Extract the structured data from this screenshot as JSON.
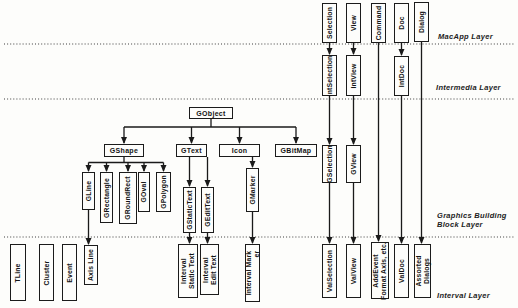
{
  "canvas": {
    "width": 518,
    "height": 308,
    "background": "#fdfdfb",
    "ink": "#1a1a1a"
  },
  "layers": [
    {
      "id": "macapp",
      "label_lines": [
        "MacApp Layer"
      ],
      "label_x": 438,
      "label_y": 32,
      "divider_y": 44
    },
    {
      "id": "intermedia",
      "label_lines": [
        "Intermedia Layer"
      ],
      "label_x": 436,
      "label_y": 83,
      "divider_y": 99
    },
    {
      "id": "graphics",
      "label_lines": [
        "Graphics Building",
        "Block Layer"
      ],
      "label_x": 437,
      "label_y": 211,
      "divider_y": 237
    },
    {
      "id": "interval",
      "label_lines": [
        "Interval Layer"
      ],
      "label_x": 437,
      "label_y": 291,
      "divider_y": null
    }
  ],
  "nodes": [
    {
      "id": "selection",
      "lines": [
        "Selection"
      ],
      "x": 322,
      "y": 3,
      "w": 15,
      "h": 40,
      "orient": "v"
    },
    {
      "id": "view",
      "lines": [
        "View"
      ],
      "x": 346,
      "y": 3,
      "w": 15,
      "h": 40,
      "orient": "v"
    },
    {
      "id": "command",
      "lines": [
        "Command"
      ],
      "x": 371,
      "y": 3,
      "w": 15,
      "h": 40,
      "orient": "v"
    },
    {
      "id": "doc",
      "lines": [
        "Doc"
      ],
      "x": 394,
      "y": 3,
      "w": 15,
      "h": 40,
      "orient": "v"
    },
    {
      "id": "dialog",
      "lines": [
        "Dialog"
      ],
      "x": 414,
      "y": 2,
      "w": 15,
      "h": 40,
      "orient": "v"
    },
    {
      "id": "int-selection",
      "lines": [
        "IntSelection"
      ],
      "x": 322,
      "y": 55,
      "w": 15,
      "h": 41,
      "orient": "v"
    },
    {
      "id": "int-view",
      "lines": [
        "IntView"
      ],
      "x": 346,
      "y": 55,
      "w": 15,
      "h": 41,
      "orient": "v"
    },
    {
      "id": "int-doc",
      "lines": [
        "IntDoc"
      ],
      "x": 394,
      "y": 56,
      "w": 15,
      "h": 40,
      "orient": "v"
    },
    {
      "id": "gobject",
      "lines": [
        "GObject"
      ],
      "x": 189,
      "y": 107,
      "w": 44,
      "h": 12,
      "orient": "h"
    },
    {
      "id": "gshape",
      "lines": [
        "GShape"
      ],
      "x": 104,
      "y": 144,
      "w": 40,
      "h": 13,
      "orient": "h"
    },
    {
      "id": "gtext",
      "lines": [
        "GText"
      ],
      "x": 176,
      "y": 144,
      "w": 31,
      "h": 13,
      "orient": "h"
    },
    {
      "id": "icon",
      "lines": [
        "Icon"
      ],
      "x": 219,
      "y": 144,
      "w": 41,
      "h": 13,
      "orient": "h"
    },
    {
      "id": "gbitmap",
      "lines": [
        "GBitMap"
      ],
      "x": 275,
      "y": 144,
      "w": 42,
      "h": 13,
      "orient": "h"
    },
    {
      "id": "gline",
      "lines": [
        "GLine"
      ],
      "x": 82,
      "y": 172,
      "w": 13,
      "h": 38,
      "orient": "v"
    },
    {
      "id": "grectangle",
      "lines": [
        "GRectangle"
      ],
      "x": 100,
      "y": 172,
      "w": 13,
      "h": 51,
      "orient": "v"
    },
    {
      "id": "groundrect",
      "lines": [
        "GRoundRect"
      ],
      "x": 119,
      "y": 172,
      "w": 18,
      "h": 52,
      "orient": "v"
    },
    {
      "id": "goval",
      "lines": [
        "GOval"
      ],
      "x": 138,
      "y": 172,
      "w": 12,
      "h": 40,
      "orient": "v"
    },
    {
      "id": "gpolygon",
      "lines": [
        "GPolygon"
      ],
      "x": 156,
      "y": 172,
      "w": 15,
      "h": 40,
      "orient": "v"
    },
    {
      "id": "gstatictext",
      "lines": [
        "GStaticText"
      ],
      "x": 183,
      "y": 187,
      "w": 13,
      "h": 46,
      "orient": "v"
    },
    {
      "id": "gedittext",
      "lines": [
        "GEditText"
      ],
      "x": 201,
      "y": 187,
      "w": 13,
      "h": 46,
      "orient": "v"
    },
    {
      "id": "gmarker",
      "lines": [
        "GMarker"
      ],
      "x": 246,
      "y": 168,
      "w": 13,
      "h": 44,
      "orient": "v"
    },
    {
      "id": "gselection",
      "lines": [
        "GSelection"
      ],
      "x": 322,
      "y": 145,
      "w": 15,
      "h": 38,
      "orient": "v"
    },
    {
      "id": "gview",
      "lines": [
        "GView"
      ],
      "x": 346,
      "y": 145,
      "w": 15,
      "h": 38,
      "orient": "v"
    },
    {
      "id": "tline",
      "lines": [
        "TLine"
      ],
      "x": 10,
      "y": 244,
      "w": 16,
      "h": 57,
      "orient": "v"
    },
    {
      "id": "cluster",
      "lines": [
        "Cluster"
      ],
      "x": 39,
      "y": 244,
      "w": 15,
      "h": 57,
      "orient": "v"
    },
    {
      "id": "event",
      "lines": [
        "Event"
      ],
      "x": 62,
      "y": 244,
      "w": 15,
      "h": 57,
      "orient": "v"
    },
    {
      "id": "axis-line",
      "lines": [
        "Axis Line"
      ],
      "x": 84,
      "y": 245,
      "w": 14,
      "h": 40,
      "orient": "v"
    },
    {
      "id": "interval-static-text",
      "lines": [
        "Interval",
        "Static Text"
      ],
      "x": 178,
      "y": 244,
      "w": 20,
      "h": 54,
      "orient": "v"
    },
    {
      "id": "interval-edit-text",
      "lines": [
        "Interval",
        "Edit Text"
      ],
      "x": 200,
      "y": 244,
      "w": 19,
      "h": 51,
      "orient": "v"
    },
    {
      "id": "interval-marker",
      "lines": [
        "Interval Mark",
        "er"
      ],
      "x": 245,
      "y": 244,
      "w": 15,
      "h": 58,
      "orient": "v",
      "align": "end"
    },
    {
      "id": "val-selection",
      "lines": [
        "ValSelection"
      ],
      "x": 322,
      "y": 244,
      "w": 15,
      "h": 54,
      "orient": "v"
    },
    {
      "id": "val-view",
      "lines": [
        "ValView"
      ],
      "x": 346,
      "y": 244,
      "w": 15,
      "h": 54,
      "orient": "v"
    },
    {
      "id": "addevent-format-axis",
      "lines": [
        "AddEvent",
        "Format Axis, etc."
      ],
      "x": 371,
      "y": 242,
      "w": 18,
      "h": 57,
      "orient": "v"
    },
    {
      "id": "val-doc",
      "lines": [
        "ValDoc"
      ],
      "x": 394,
      "y": 244,
      "w": 15,
      "h": 54,
      "orient": "v"
    },
    {
      "id": "assorted-dialogs",
      "lines": [
        "Assorted",
        "Dialogs"
      ],
      "x": 414,
      "y": 244,
      "w": 17,
      "h": 54,
      "orient": "v"
    }
  ],
  "edges": [
    {
      "name": "selection-to-intselection",
      "pts": [
        [
          329.5,
          43
        ],
        [
          329.5,
          54
        ]
      ],
      "arrow": true
    },
    {
      "name": "view-to-intview",
      "pts": [
        [
          353.5,
          43
        ],
        [
          353.5,
          54
        ]
      ],
      "arrow": true
    },
    {
      "name": "doc-to-intdoc",
      "pts": [
        [
          401.5,
          43
        ],
        [
          401.5,
          55
        ]
      ],
      "arrow": true
    },
    {
      "name": "command-to-addevent",
      "pts": [
        [
          378.5,
          43
        ],
        [
          378.5,
          241
        ]
      ],
      "arrow": true
    },
    {
      "name": "dialog-to-assorted-dialogs",
      "pts": [
        [
          421.5,
          42
        ],
        [
          421.5,
          243
        ]
      ],
      "arrow": true
    },
    {
      "name": "intselection-to-gselection",
      "pts": [
        [
          329.5,
          96
        ],
        [
          329.5,
          144
        ]
      ],
      "arrow": true
    },
    {
      "name": "intview-to-gview",
      "pts": [
        [
          353.5,
          96
        ],
        [
          353.5,
          144
        ]
      ],
      "arrow": true
    },
    {
      "name": "intdoc-to-valdoc",
      "pts": [
        [
          401.5,
          96
        ],
        [
          401.5,
          243
        ]
      ],
      "arrow": true
    },
    {
      "name": "gselection-to-valselection",
      "pts": [
        [
          329.5,
          183
        ],
        [
          329.5,
          243
        ]
      ],
      "arrow": true
    },
    {
      "name": "gview-to-valview",
      "pts": [
        [
          353.5,
          183
        ],
        [
          353.5,
          243
        ]
      ],
      "arrow": true
    },
    {
      "name": "gline-to-axis-line",
      "pts": [
        [
          88.5,
          210
        ],
        [
          88.5,
          244
        ]
      ],
      "arrow": true
    },
    {
      "name": "gstatictext-to-interval-static-text",
      "pts": [
        [
          189.5,
          233
        ],
        [
          189.5,
          243
        ]
      ],
      "arrow": true
    },
    {
      "name": "gedittext-to-interval-edit-text",
      "pts": [
        [
          207.5,
          233
        ],
        [
          207.5,
          243
        ]
      ],
      "arrow": true
    },
    {
      "name": "gmarker-to-interval-marker",
      "pts": [
        [
          252.5,
          212
        ],
        [
          252.5,
          243
        ]
      ],
      "arrow": true
    },
    {
      "name": "icon-to-gmarker",
      "pts": [
        [
          252.5,
          157
        ],
        [
          252.5,
          167
        ]
      ],
      "arrow": true
    },
    {
      "name": "gobject-stem",
      "pts": [
        [
          211,
          119
        ],
        [
          211,
          127
        ]
      ],
      "arrow": false
    },
    {
      "name": "gobject-branch-bar",
      "pts": [
        [
          124,
          127
        ],
        [
          296,
          127
        ]
      ],
      "arrow": false
    },
    {
      "name": "gobject-to-gshape",
      "pts": [
        [
          124,
          127
        ],
        [
          124,
          143
        ]
      ],
      "arrow": true
    },
    {
      "name": "gobject-to-gtext",
      "pts": [
        [
          191.5,
          127
        ],
        [
          191.5,
          143
        ]
      ],
      "arrow": true
    },
    {
      "name": "gobject-to-icon",
      "pts": [
        [
          239.5,
          127
        ],
        [
          239.5,
          143
        ]
      ],
      "arrow": true
    },
    {
      "name": "gobject-to-gbitmap",
      "pts": [
        [
          296,
          127
        ],
        [
          296,
          143
        ]
      ],
      "arrow": true
    },
    {
      "name": "gshape-stem",
      "pts": [
        [
          124,
          157
        ],
        [
          124,
          162.5
        ]
      ],
      "arrow": false
    },
    {
      "name": "gshape-branch-bar",
      "pts": [
        [
          88.5,
          162.5
        ],
        [
          163.5,
          162.5
        ]
      ],
      "arrow": false
    },
    {
      "name": "gshape-to-gline",
      "pts": [
        [
          88.5,
          162.5
        ],
        [
          88.5,
          171
        ]
      ],
      "arrow": true
    },
    {
      "name": "gshape-to-grectangle",
      "pts": [
        [
          106.5,
          162.5
        ],
        [
          106.5,
          171
        ]
      ],
      "arrow": true
    },
    {
      "name": "gshape-to-groundrect",
      "pts": [
        [
          128,
          162.5
        ],
        [
          128,
          171
        ]
      ],
      "arrow": true
    },
    {
      "name": "gshape-to-goval",
      "pts": [
        [
          144,
          162.5
        ],
        [
          144,
          171
        ]
      ],
      "arrow": true
    },
    {
      "name": "gshape-to-gpolygon",
      "pts": [
        [
          163.5,
          162.5
        ],
        [
          163.5,
          171
        ]
      ],
      "arrow": true
    },
    {
      "name": "gtext-to-gstatictext",
      "pts": [
        [
          189.5,
          157
        ],
        [
          189.5,
          186
        ]
      ],
      "arrow": true
    },
    {
      "name": "gtext-to-gedittext",
      "pts": [
        [
          207.5,
          157
        ],
        [
          207.5,
          186
        ]
      ],
      "arrow": true
    }
  ],
  "divider_x_start": 4,
  "divider_x_end": 514
}
